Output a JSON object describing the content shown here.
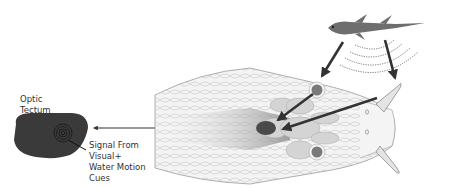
{
  "diagram": {
    "labels": {
      "optic_tectum": [
        "Optic",
        "Tectum"
      ],
      "signal": [
        "Signal From",
        "Visual+",
        "Water Motion",
        "Cues"
      ]
    },
    "colors": {
      "tectum_fill": "#3a3a3a",
      "arrow": "#333333",
      "head_outline": "#9a9a9a",
      "head_fill": "#f4f4f4",
      "brain_light": "#d4d4d4",
      "brain_dark": "#4a4a4a",
      "eye": "#7a7a7a",
      "fish": "#6e6e6e"
    },
    "elements": [
      "optic-tectum",
      "snake-head",
      "fish",
      "water-ripples",
      "tentacles",
      "eyes",
      "brain",
      "signal-arrows"
    ]
  }
}
